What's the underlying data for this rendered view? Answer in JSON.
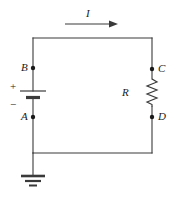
{
  "figure": {
    "kind": "circuit-schematic",
    "width": 170,
    "height": 197,
    "background_color": "#ffffff",
    "stroke_color": "#3a3a3a",
    "text_color": "#1a1a1a"
  },
  "labels": {
    "current": "I",
    "node_b": "B",
    "node_a": "A",
    "node_c": "C",
    "node_d": "D",
    "resistor": "R",
    "battery_plus": "+",
    "battery_minus": "−"
  },
  "components": [
    {
      "name": "battery",
      "terminal_positive": "B",
      "terminal_negative": "A",
      "side": "left"
    },
    {
      "name": "resistor",
      "label": "R",
      "terminal_top": "C",
      "terminal_bottom": "D",
      "side": "right"
    },
    {
      "name": "ground",
      "attached_to": "bottom-left-wire"
    },
    {
      "name": "current-arrow",
      "label": "I",
      "direction": "right",
      "position": "above-top-wire"
    }
  ],
  "nodes": [
    {
      "label": "B",
      "x": 33,
      "y": 68
    },
    {
      "label": "A",
      "x": 33,
      "y": 117
    },
    {
      "label": "C",
      "x": 152,
      "y": 69
    },
    {
      "label": "D",
      "x": 152,
      "y": 117
    }
  ]
}
